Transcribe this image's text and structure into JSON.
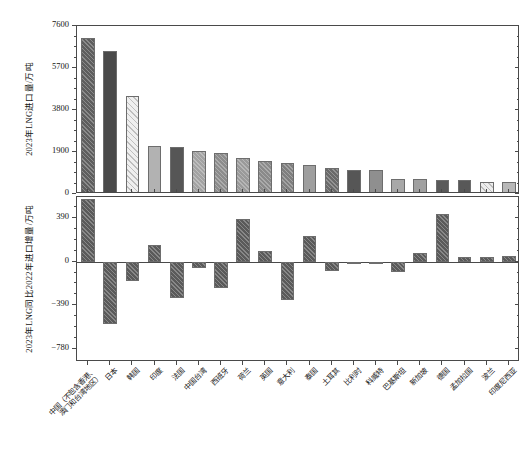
{
  "chart_data": {
    "type": "bar",
    "title": "",
    "subtitle": "",
    "panels": [
      {
        "id": "import-volume",
        "ylabel": "2023年LNG进口量/万吨",
        "ylim": [
          0,
          7600
        ],
        "yticks": [
          0,
          1900,
          3800,
          5700,
          7600
        ],
        "ytick_labels": [
          "0",
          "1900",
          "3800",
          "5700",
          "7600"
        ],
        "grid": false,
        "values": [
          7035,
          6480,
          4450,
          2180,
          2130,
          1960,
          1840,
          1610,
          1480,
          1390,
          1300,
          1190,
          1100,
          1080,
          700,
          690,
          650,
          630,
          560,
          540
        ]
      },
      {
        "id": "yoy-increment",
        "ylabel": "2023年LNG同比2022年进口增量/万吨",
        "ylim": [
          -900,
          580
        ],
        "yticks": [
          -780,
          -390,
          0,
          390
        ],
        "ytick_labels": [
          "−780",
          "−390",
          "0",
          "390"
        ],
        "grid": false,
        "values": [
          560,
          -560,
          -170,
          150,
          -330,
          -55,
          -240,
          385,
          95,
          -340,
          230,
          -85,
          -8,
          0,
          -95,
          80,
          430,
          40,
          40,
          55
        ]
      }
    ],
    "categories": [
      "中国（不包含香港、澳门和台湾地区）",
      "日本",
      "韩国",
      "印度",
      "法国",
      "中国台湾",
      "西班牙",
      "荷兰",
      "英国",
      "意大利",
      "泰国",
      "土耳其",
      "比利时",
      "科威特",
      "巴基斯坦",
      "新加坡",
      "德国",
      "孟加拉国",
      "波兰",
      "印度尼西亚"
    ],
    "category_lines": [
      [
        "中国（不包含香港、",
        "澳门和台湾地区）"
      ],
      [
        "日本"
      ],
      [
        "韩国"
      ],
      [
        "印度"
      ],
      [
        "法国"
      ],
      [
        "中国台湾"
      ],
      [
        "西班牙"
      ],
      [
        "荷兰"
      ],
      [
        "英国"
      ],
      [
        "意大利"
      ],
      [
        "泰国"
      ],
      [
        "土耳其"
      ],
      [
        "比利时"
      ],
      [
        "科威特"
      ],
      [
        "巴基斯坦"
      ],
      [
        "新加坡"
      ],
      [
        "德国"
      ],
      [
        "孟加拉国"
      ],
      [
        "波兰"
      ],
      [
        "印度尼西亚"
      ]
    ],
    "bar_styles": [
      {
        "fill": "#5e5e5e",
        "hatch": "diag"
      },
      {
        "fill": "#4a4a4a",
        "hatch": "none"
      },
      {
        "fill": "#efefef",
        "hatch": "diag-light"
      },
      {
        "fill": "#b2b2b2",
        "hatch": "none"
      },
      {
        "fill": "#565656",
        "hatch": "none"
      },
      {
        "fill": "#a3a3a3",
        "hatch": "diag"
      },
      {
        "fill": "#8c8c8c",
        "hatch": "diag"
      },
      {
        "fill": "#9a9a9a",
        "hatch": "diag"
      },
      {
        "fill": "#8a8a8a",
        "hatch": "diag"
      },
      {
        "fill": "#7f7f7f",
        "hatch": "diag"
      },
      {
        "fill": "#9e9e9e",
        "hatch": "none"
      },
      {
        "fill": "#6a6a6a",
        "hatch": "diag"
      },
      {
        "fill": "#565656",
        "hatch": "none"
      },
      {
        "fill": "#8f8f8f",
        "hatch": "none"
      },
      {
        "fill": "#a8a8a8",
        "hatch": "none"
      },
      {
        "fill": "#a0a0a0",
        "hatch": "none"
      },
      {
        "fill": "#5a5a5a",
        "hatch": "none"
      },
      {
        "fill": "#585858",
        "hatch": "none"
      },
      {
        "fill": "#ededed",
        "hatch": "diag-light"
      },
      {
        "fill": "#b8b8b8",
        "hatch": "none"
      }
    ],
    "increment_bar_style": {
      "fill": "#5a5a5a",
      "hatch": "diag"
    },
    "colors": {
      "axis": "#4a4a4a",
      "text": "#141414",
      "background": "#ffffff"
    }
  }
}
